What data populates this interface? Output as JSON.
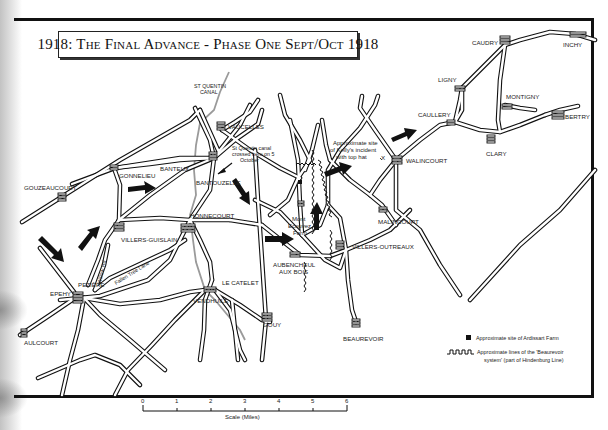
{
  "title": "1918: The Final Advance - Phase One Sept/Oct 1918",
  "places": [
    {
      "name": "St Quentin Canal",
      "line1": "ST QUENTIN",
      "line2": "CANAL"
    },
    {
      "name": "VAUCELLES"
    },
    {
      "name": "CAUDRY"
    },
    {
      "name": "INCHY"
    },
    {
      "name": "LIGNY"
    },
    {
      "name": "MONTIGNY"
    },
    {
      "name": "BERTRY"
    },
    {
      "name": "CAULLERY"
    },
    {
      "name": "CLARY"
    },
    {
      "name": "WALINCOURT"
    },
    {
      "name": "MALINCOURT"
    },
    {
      "name": "VILLERS-OUTREAUX"
    },
    {
      "name": "BEAUREVOIR"
    },
    {
      "name": "AUBENCHEUL",
      "line2": "AUX BOIS"
    },
    {
      "name": "GOUY"
    },
    {
      "name": "LE CATELET"
    },
    {
      "name": "VENDHUILE"
    },
    {
      "name": "HONNECOURT"
    },
    {
      "name": "BANTEUX"
    },
    {
      "name": "BANTOUZELLE"
    },
    {
      "name": "GONNELIEU"
    },
    {
      "name": "GOUZEAUCOURT"
    },
    {
      "name": "VILLERS-GUISLAIN"
    },
    {
      "name": "PEZIÈRE"
    },
    {
      "name": "EPEHY"
    },
    {
      "name": "AULCOURT"
    }
  ],
  "road_names": {
    "willow": "Willow Rd",
    "fallen_tree": "Fallen Tree Lane"
  },
  "annotations": {
    "canal_crossing": [
      "St Quentin canal",
      "crossed here on 5",
      "October"
    ],
    "kelly": [
      "Approximate site",
      "of Kelly's incident",
      "with top hat"
    ],
    "kelly_marker": "X",
    "mont_ecouvez": [
      "Mont",
      "Ecouvez",
      "Farm"
    ]
  },
  "scale": {
    "ticks": [
      "0",
      "1",
      "2",
      "3",
      "4",
      "5",
      "6"
    ],
    "label": "Scale (Miles)"
  },
  "legend": {
    "farm": "Approximate site of Ardissart Farm",
    "trench_line1": "Approximate lines of the 'Beaurevoir",
    "trench_line2": "system' (part of Hindenburg Line)"
  },
  "colors": {
    "ink": "#111111",
    "canal": "#9a9a9a",
    "paper": "#ffffff"
  }
}
